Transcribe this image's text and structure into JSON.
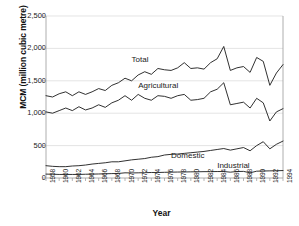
{
  "chart_data": {
    "type": "line",
    "title": "",
    "xlabel": "Year",
    "ylabel": "MCM (million cubic metre)",
    "xlim": [
      1958,
      1994
    ],
    "ylim": [
      0,
      2500
    ],
    "yticks": [
      0,
      500,
      1000,
      1500,
      2000,
      2500
    ],
    "ytick_labels": [
      "0",
      "500",
      "1,000",
      "1,500",
      "2,000",
      "2,500"
    ],
    "x": [
      1958,
      1959,
      1960,
      1961,
      1962,
      1963,
      1964,
      1965,
      1966,
      1967,
      1968,
      1969,
      1970,
      1971,
      1972,
      1973,
      1974,
      1975,
      1976,
      1977,
      1978,
      1979,
      1980,
      1981,
      1982,
      1983,
      1984,
      1985,
      1986,
      1987,
      1988,
      1989,
      1990,
      1991,
      1992,
      1993,
      1994
    ],
    "xtick_labels": [
      "1958",
      "1959",
      "1960",
      "1961",
      "1962",
      "1963",
      "1964",
      "1965",
      "1966",
      "1967",
      "1968",
      "1969",
      "1970",
      "1971",
      "1972",
      "1973",
      "1974",
      "1975",
      "1976",
      "1977",
      "1978",
      "1979",
      "1980",
      "1981",
      "1982",
      "1983",
      "1984",
      "1985",
      "1986",
      "1987",
      "1988",
      "1989",
      "1990",
      "1991",
      "1992",
      "1993",
      "1994"
    ],
    "xtick_labels_shown": [
      "1958",
      "1960",
      "1962",
      "1964",
      "1966",
      "1968",
      "1970",
      "1972",
      "1974",
      "1976",
      "1978",
      "1980",
      "1982",
      "1984",
      "1986",
      "1988",
      "1990",
      "1992",
      "1994"
    ],
    "grid": true,
    "grid_axis": "y",
    "legend_position": "inline-labels",
    "series": [
      {
        "name": "Total",
        "label": "Total",
        "color": "#1a1a1a",
        "values": [
          1270,
          1250,
          1300,
          1330,
          1270,
          1330,
          1290,
          1330,
          1380,
          1350,
          1430,
          1470,
          1540,
          1500,
          1590,
          1640,
          1600,
          1690,
          1670,
          1660,
          1700,
          1780,
          1690,
          1700,
          1680,
          1780,
          1840,
          2030,
          1660,
          1700,
          1720,
          1630,
          1860,
          1800,
          1430,
          1620,
          1750
        ]
      },
      {
        "name": "Agricultural",
        "label": "Agricultural",
        "color": "#1a1a1a",
        "values": [
          1020,
          1000,
          1040,
          1080,
          1040,
          1100,
          1050,
          1080,
          1130,
          1090,
          1160,
          1200,
          1270,
          1200,
          1290,
          1230,
          1200,
          1270,
          1260,
          1230,
          1270,
          1290,
          1200,
          1210,
          1230,
          1330,
          1370,
          1470,
          1130,
          1150,
          1170,
          1080,
          1230,
          1160,
          880,
          1020,
          1070
        ]
      },
      {
        "name": "Domestic",
        "label": "Domestic",
        "color": "#1a1a1a",
        "values": [
          190,
          180,
          175,
          175,
          185,
          190,
          200,
          215,
          225,
          235,
          250,
          250,
          265,
          280,
          290,
          300,
          320,
          330,
          355,
          365,
          370,
          380,
          390,
          400,
          410,
          425,
          440,
          455,
          430,
          450,
          470,
          420,
          500,
          560,
          450,
          520,
          570
        ]
      },
      {
        "name": "Industrial",
        "label": "Industrial",
        "color": "#1a1a1a",
        "values": [
          60,
          58,
          55,
          55,
          55,
          55,
          58,
          60,
          62,
          65,
          68,
          70,
          80,
          78,
          80,
          82,
          85,
          85,
          88,
          90,
          92,
          93,
          95,
          96,
          98,
          98,
          100,
          100,
          90,
          100,
          102,
          80,
          105,
          108,
          110,
          112,
          115
        ]
      }
    ],
    "annotations": [
      {
        "text": "Total",
        "x": 1971,
        "y": 1800
      },
      {
        "text": "Agricultural",
        "x": 1972,
        "y": 1410
      },
      {
        "text": "Domestic",
        "x": 1977,
        "y": 330
      },
      {
        "text": "Industrial",
        "x": 1984,
        "y": 175
      }
    ]
  },
  "style": {
    "axis_color": "#999999",
    "grid_color": "#d9d9d9",
    "line_color": "#1a1a1a",
    "text_color": "#222222",
    "background": "#ffffff"
  }
}
